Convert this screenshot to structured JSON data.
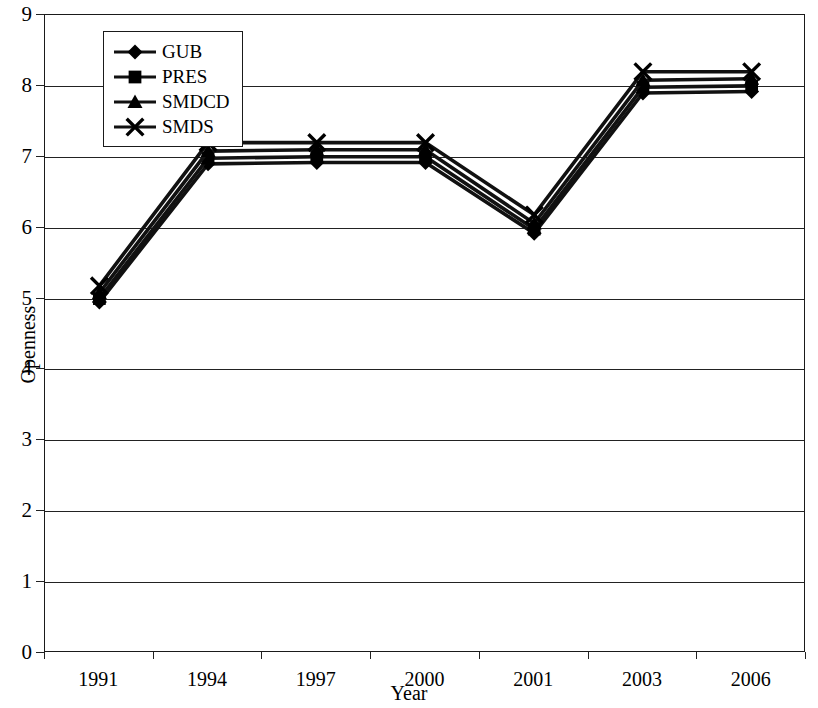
{
  "chart_data": {
    "type": "line",
    "title": "",
    "xlabel": "Year",
    "ylabel": "Openness",
    "categories": [
      "1991",
      "1994",
      "1997",
      "2000",
      "2001",
      "2003",
      "2006"
    ],
    "ylim": [
      0,
      9
    ],
    "yticks": [
      "0",
      "1",
      "2",
      "3",
      "4",
      "5",
      "6",
      "7",
      "8",
      "9"
    ],
    "grid": true,
    "legend_position": "top-left inside",
    "series": [
      {
        "name": "GUB",
        "marker": "diamond",
        "values": [
          4.95,
          6.9,
          6.92,
          6.92,
          5.92,
          7.9,
          7.92
        ]
      },
      {
        "name": "PRES",
        "marker": "square",
        "values": [
          5.0,
          6.98,
          7.0,
          7.0,
          5.98,
          7.98,
          8.0
        ]
      },
      {
        "name": "SMDCD",
        "marker": "triangle",
        "values": [
          5.08,
          7.08,
          7.1,
          7.1,
          6.06,
          8.08,
          8.1
        ]
      },
      {
        "name": "SMDS",
        "marker": "cross",
        "values": [
          5.18,
          7.2,
          7.2,
          7.2,
          6.18,
          8.2,
          8.2
        ]
      }
    ],
    "line_color": "#111111",
    "marker_color": "#000000",
    "axis_color": "#222222"
  },
  "legend": {
    "items": [
      {
        "label": "GUB",
        "icon": "diamond-marker-icon"
      },
      {
        "label": "PRES",
        "icon": "square-marker-icon"
      },
      {
        "label": "SMDCD",
        "icon": "triangle-marker-icon"
      },
      {
        "label": "SMDS",
        "icon": "cross-marker-icon"
      }
    ]
  }
}
